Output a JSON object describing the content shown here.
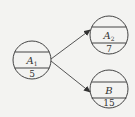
{
  "diagram": {
    "type": "network-node-diagram",
    "colors": {
      "background": "#f3f3f1",
      "stroke": "#444444",
      "text": "#333333"
    },
    "nodes": [
      {
        "id": "A1",
        "label": "A",
        "subscript": "1",
        "value": "5",
        "cx": 32,
        "cy": 60,
        "r": 19
      },
      {
        "id": "A2",
        "label": "A",
        "subscript": "2",
        "value": "7",
        "cx": 109,
        "cy": 35,
        "r": 19
      },
      {
        "id": "B",
        "label": "B",
        "subscript": "",
        "value": "15",
        "cx": 109,
        "cy": 89,
        "r": 19
      }
    ],
    "edges": [
      {
        "from": "A1",
        "to": "A2"
      },
      {
        "from": "A1",
        "to": "B"
      }
    ]
  }
}
